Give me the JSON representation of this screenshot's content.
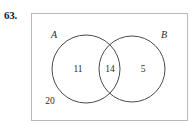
{
  "problem": {
    "number": "63."
  },
  "diagram": {
    "type": "venn-diagram",
    "universe_label": "",
    "sets": [
      {
        "name": "A",
        "label": "A"
      },
      {
        "name": "B",
        "label": "B"
      }
    ],
    "regions": [
      {
        "name": "only-a",
        "label": "A only",
        "value": "11"
      },
      {
        "name": "intersection",
        "label": "A and B",
        "value": "14"
      },
      {
        "name": "only-b",
        "label": "B only",
        "value": "5"
      },
      {
        "name": "outside",
        "label": "Neither A nor B",
        "value": "20"
      }
    ],
    "geometry": {
      "rect": {
        "x": 31,
        "y": 13,
        "width": 157,
        "height": 108
      },
      "circle_a": {
        "cx": 86,
        "cy": 69,
        "r": 34
      },
      "circle_b": {
        "cx": 132,
        "cy": 69,
        "r": 33
      }
    },
    "colors": {
      "stroke": "#4a4a4a",
      "rect_border": "#b9b9b9",
      "text": "#2b2b2b",
      "background": "#ffffff"
    }
  }
}
